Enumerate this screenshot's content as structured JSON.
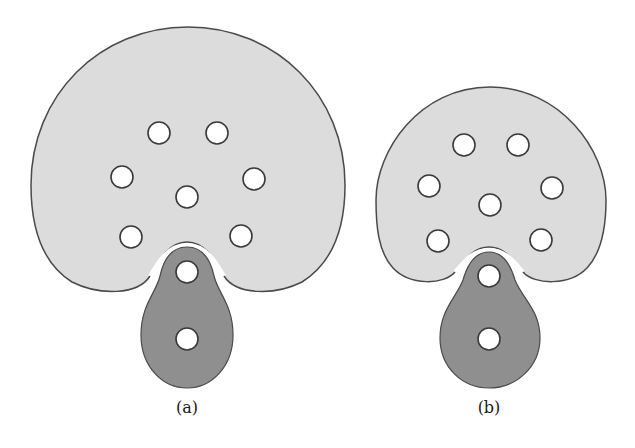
{
  "figure": {
    "colors": {
      "background": "#ffffff",
      "light_region_fill": "#dcdcdc",
      "dark_region_fill": "#8f8f8f",
      "outline": "#4a4a4a",
      "hole_fill": "#ffffff",
      "hole_stroke": "#3a3a3a"
    },
    "hole_radius": 11,
    "panels": [
      {
        "id": "a",
        "caption": "(a)",
        "light_region": {
          "top": 27,
          "bottom": 291,
          "left": 31,
          "right": 345,
          "notch_apex": [
            187,
            242
          ]
        },
        "dark_region": {
          "top": 247,
          "bottom": 388,
          "left": 141,
          "right": 233
        },
        "light_holes": [
          [
            159,
            133
          ],
          [
            217,
            133
          ],
          [
            122,
            177
          ],
          [
            254,
            179
          ],
          [
            187,
            197
          ],
          [
            131,
            237
          ],
          [
            241,
            236
          ]
        ],
        "dark_holes": [
          [
            187,
            272
          ],
          [
            187,
            339
          ]
        ]
      },
      {
        "id": "b",
        "caption": "(b)",
        "light_region": {
          "top": 87,
          "bottom": 282,
          "left": 376,
          "right": 606,
          "notch_apex": [
            489,
            247
          ]
        },
        "dark_region": {
          "top": 252,
          "bottom": 388,
          "left": 440,
          "right": 540
        },
        "light_holes": [
          [
            464,
            145
          ],
          [
            518,
            145
          ],
          [
            429,
            186
          ],
          [
            552,
            188
          ],
          [
            490,
            205
          ],
          [
            438,
            241
          ],
          [
            541,
            240
          ]
        ],
        "dark_holes": [
          [
            489,
            276
          ],
          [
            489,
            339
          ]
        ]
      }
    ]
  }
}
